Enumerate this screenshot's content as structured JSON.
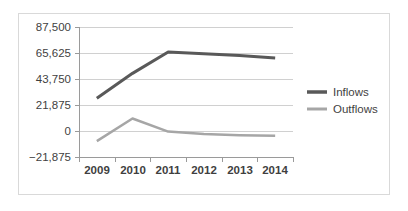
{
  "chart_data": {
    "type": "line",
    "title": "",
    "xlabel": "",
    "ylabel": "",
    "categories": [
      "2009",
      "2010",
      "2011",
      "2012",
      "2013",
      "2014"
    ],
    "series": [
      {
        "name": "Inflows",
        "color": "#595959",
        "values": [
          27500,
          48500,
          66500,
          65000,
          63500,
          61500
        ]
      },
      {
        "name": "Outflows",
        "color": "#a6a6a6",
        "values": [
          -8500,
          10500,
          -500,
          -2500,
          -3500,
          -4000
        ]
      }
    ],
    "ylim": [
      -21875,
      87500
    ],
    "yticks": [
      87500,
      65625,
      43750,
      21875,
      0,
      -21875
    ],
    "ytick_labels": [
      "87,500",
      "65,625",
      "43,750",
      "21,875",
      "0",
      "−21,875"
    ],
    "xtick_labels": [
      "2009",
      "2010",
      "2011",
      "2012",
      "2013",
      "2014"
    ],
    "grid": true,
    "legend_position": "right",
    "legend_entries": [
      "Inflows",
      "Outflows"
    ]
  },
  "legend": {
    "inflows_label": "Inflows",
    "outflows_label": "Outflows"
  },
  "axis": {
    "y0": "87,500",
    "y1": "65,625",
    "y2": "43,750",
    "y3": "21,875",
    "y4": "0",
    "y5": "−21,875",
    "x0": "2009",
    "x1": "2010",
    "x2": "2011",
    "x3": "2012",
    "x4": "2013",
    "x5": "2014"
  }
}
